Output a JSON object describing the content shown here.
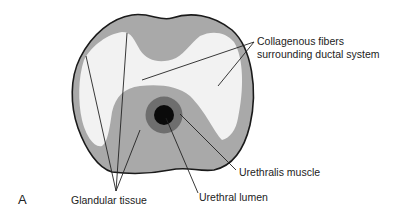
{
  "figure": {
    "panel_label": "A",
    "labels": {
      "collagenous_line1": "Collagenous fibers",
      "collagenous_line2": "surrounding ductal system",
      "urethralis_muscle": "Urethralis muscle",
      "urethral_lumen": "Urethral lumen",
      "glandular_tissue": "Glandular tissue"
    },
    "colors": {
      "outline": "#1a1a1a",
      "glandular_tissue": "#a9a9a9",
      "collagenous_fibers": "#f2f2f2",
      "urethralis_muscle": "#6e6e6e",
      "urethral_lumen": "#0a0a0a",
      "leader_lines": "#222222"
    }
  }
}
